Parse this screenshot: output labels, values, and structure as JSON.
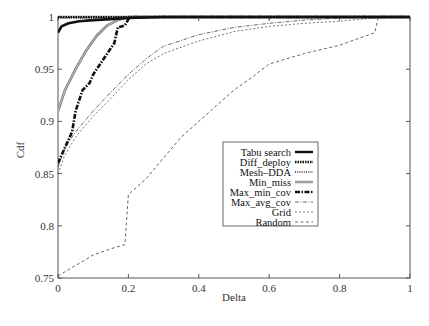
{
  "chart_data": {
    "type": "line",
    "title": "",
    "xlabel": "Delta",
    "ylabel": "Cdf",
    "xlim": [
      0,
      1
    ],
    "ylim": [
      0.75,
      1
    ],
    "xticks": [
      0,
      0.2,
      0.4,
      0.6,
      0.8,
      1
    ],
    "xtick_labels": [
      "0",
      "0.2",
      "0.4",
      "0.6",
      "0.8",
      "1"
    ],
    "yticks": [
      0.75,
      0.8,
      0.85,
      0.9,
      0.95,
      1
    ],
    "ytick_labels": [
      "0.75",
      "0.8",
      "0.85",
      "0.9",
      "0.95",
      "1"
    ],
    "grid": false,
    "legend_position": "center-right",
    "series": [
      {
        "name": "Tabu search",
        "style": "solid-thick",
        "color": "#111111",
        "x": [
          0,
          0.01,
          0.03,
          0.06,
          0.1,
          0.15,
          0.2,
          0.3,
          0.5,
          1.0
        ],
        "y": [
          0.985,
          0.991,
          0.994,
          0.996,
          0.997,
          0.998,
          0.999,
          1.0,
          1.0,
          1.0
        ]
      },
      {
        "name": "Diff_deploy",
        "style": "dotted-thick",
        "color": "#111111",
        "x": [
          0,
          0.05,
          0.2,
          0.5,
          1.0
        ],
        "y": [
          1.0,
          1.0,
          1.0,
          1.0,
          1.0
        ]
      },
      {
        "name": "Mesh-DDA",
        "style": "dotted",
        "color": "#333333",
        "x": [
          0,
          0.1,
          0.2,
          0.5,
          1.0
        ],
        "y": [
          0.999,
          0.999,
          1.0,
          1.0,
          1.0
        ]
      },
      {
        "name": "Min_miss",
        "style": "double-gray",
        "color": "#777777",
        "x": [
          0,
          0.02,
          0.05,
          0.08,
          0.11,
          0.14,
          0.17,
          0.19,
          0.2,
          0.3,
          1.0
        ],
        "y": [
          0.91,
          0.93,
          0.95,
          0.968,
          0.982,
          0.992,
          0.997,
          0.999,
          1.0,
          1.0,
          1.0
        ]
      },
      {
        "name": "Max_min_cov",
        "style": "dash-dot-thick",
        "color": "#111111",
        "x": [
          0,
          0.02,
          0.04,
          0.05,
          0.07,
          0.09,
          0.1,
          0.12,
          0.14,
          0.16,
          0.17,
          0.18,
          0.19,
          0.2,
          0.21,
          0.3,
          1.0
        ],
        "y": [
          0.86,
          0.875,
          0.89,
          0.91,
          0.93,
          0.937,
          0.945,
          0.955,
          0.965,
          0.975,
          0.99,
          0.991,
          0.992,
          0.998,
          1.0,
          1.0,
          1.0
        ]
      },
      {
        "name": "Max_avg_cov",
        "style": "dash-dot-thin",
        "color": "#444444",
        "x": [
          0,
          0.02,
          0.05,
          0.1,
          0.15,
          0.2,
          0.25,
          0.3,
          0.4,
          0.5,
          0.6,
          0.7,
          0.8,
          0.9,
          1.0
        ],
        "y": [
          0.856,
          0.875,
          0.89,
          0.91,
          0.928,
          0.945,
          0.96,
          0.972,
          0.983,
          0.99,
          0.994,
          0.997,
          0.999,
          1.0,
          1.0
        ]
      },
      {
        "name": "Grid",
        "style": "dashed-fine",
        "color": "#555555",
        "x": [
          0,
          0.02,
          0.05,
          0.1,
          0.15,
          0.2,
          0.25,
          0.3,
          0.4,
          0.5,
          0.6,
          0.7,
          0.8,
          0.9,
          1.0
        ],
        "y": [
          0.85,
          0.868,
          0.885,
          0.905,
          0.922,
          0.94,
          0.955,
          0.965,
          0.977,
          0.986,
          0.991,
          0.994,
          0.996,
          0.999,
          1.0
        ]
      },
      {
        "name": "Random",
        "style": "dashed",
        "color": "#555555",
        "x": [
          0,
          0.05,
          0.1,
          0.15,
          0.19,
          0.2,
          0.25,
          0.3,
          0.35,
          0.4,
          0.45,
          0.5,
          0.55,
          0.6,
          0.7,
          0.8,
          0.9,
          0.91,
          1.0
        ],
        "y": [
          0.752,
          0.762,
          0.772,
          0.778,
          0.782,
          0.83,
          0.845,
          0.865,
          0.885,
          0.9,
          0.915,
          0.93,
          0.942,
          0.955,
          0.965,
          0.973,
          0.985,
          1.0,
          1.0
        ]
      }
    ]
  },
  "legend": {
    "items": [
      "Tabu search",
      "Diff_deploy",
      "Mesh–DDA",
      "Min_miss",
      "Max_min_cov",
      "Max_avg_cov",
      "Grid",
      "Random"
    ]
  },
  "axes": {
    "xlabel": "Delta",
    "ylabel": "Cdf"
  }
}
